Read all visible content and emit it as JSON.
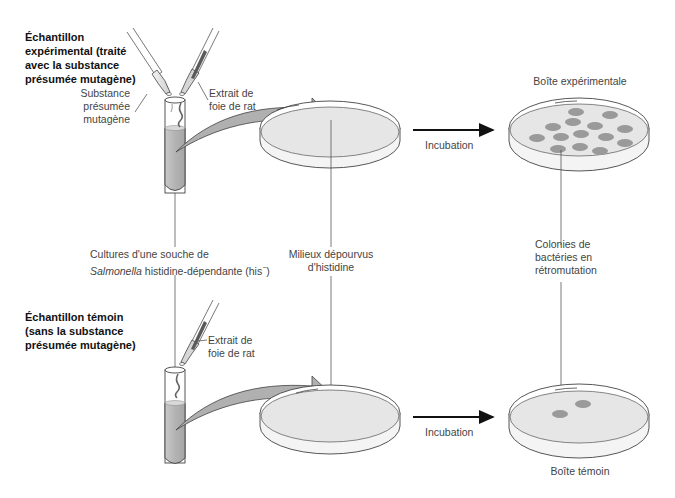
{
  "experimental": {
    "title_line1": "Échantillon",
    "title_line2": "expérimental (traité",
    "title_line3": "avec la substance",
    "title_line4": "présumée mutagène)",
    "substance_line1": "Substance",
    "substance_line2": "présumée",
    "substance_line3": "mutagène",
    "extract_line1": "Extrait de",
    "extract_line2": "foie de rat",
    "incubation": "Incubation",
    "plate_label": "Boîte expérimentale",
    "colony_count": 14
  },
  "shared_labels": {
    "cultures_line1": "Cultures d'une souche de",
    "cultures_italic": "Salmonella",
    "cultures_line2_rest": " histidine-dépendante (his",
    "cultures_sup": "−",
    "cultures_close": ")",
    "media_line1": "Milieux dépourvus",
    "media_line2": "d'histidine",
    "colonies_line1": "Colonies de",
    "colonies_line2": "bactéries en",
    "colonies_line3": "rétromutation"
  },
  "control": {
    "title_line1": "Échantillon témoin",
    "title_line2": "(sans la substance",
    "title_line3": "présumée mutagène)",
    "extract_line1": "Extrait de",
    "extract_line2": "foie de rat",
    "incubation": "Incubation",
    "plate_label": "Boîte témoin",
    "colony_count": 2
  },
  "colors": {
    "liquid": "#b8b8b8",
    "agar": "#e6e6e6",
    "colony": "#9a9a9a",
    "arrow_fill": "#b0b0b0",
    "line": "#333333"
  }
}
